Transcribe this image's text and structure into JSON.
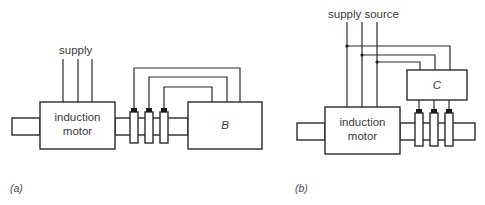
{
  "diagram_a": {
    "caption": "(a)",
    "supply_label": "supply",
    "motor_label_line1": "induction",
    "motor_label_line2": "motor",
    "load_label": "B",
    "slip_ring_count": 3
  },
  "diagram_b": {
    "caption": "(b)",
    "supply_label": "supply source",
    "motor_label_line1": "induction",
    "motor_label_line2": "motor",
    "converter_label": "C",
    "slip_ring_count": 3
  },
  "colors": {
    "line": "#2a2a2a",
    "text": "#3a3a3a",
    "background": "#ffffff"
  }
}
